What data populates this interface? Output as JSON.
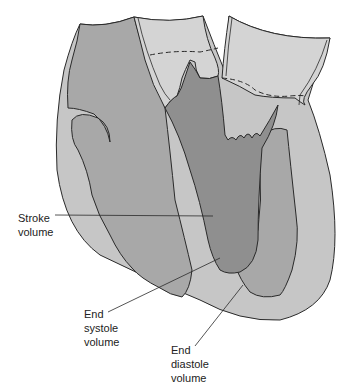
{
  "figure": {
    "colors": {
      "background": "#ffffff",
      "outer_wall": "#c6c6c6",
      "vessel_light": "#d4d4d4",
      "chamber_mid": "#a8a8a8",
      "chamber_dark": "#8f8f8f",
      "outline": "#2a2a2a"
    }
  },
  "labels": {
    "stroke_volume": {
      "line1": "Stroke",
      "line2": "volume"
    },
    "end_systole_volume": {
      "line1": "End",
      "line2": "systole",
      "line3": "volume"
    },
    "end_diastole_volume": {
      "line1": "End",
      "line2": "diastole",
      "line3": "volume"
    }
  }
}
